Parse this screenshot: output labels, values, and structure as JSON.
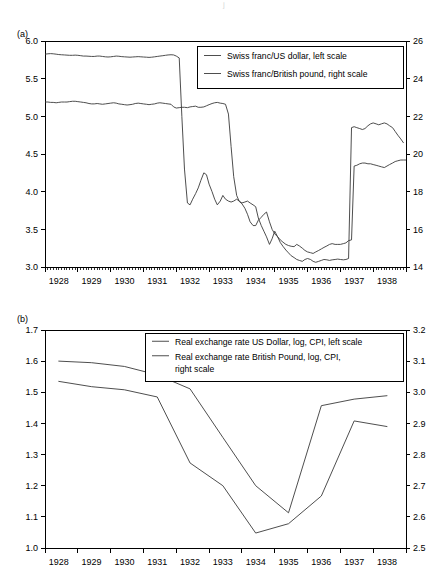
{
  "figure": {
    "top_fragment": "j",
    "panels": [
      {
        "id": "a",
        "label": "(a)"
      },
      {
        "id": "b",
        "label": "(b)"
      }
    ]
  },
  "chart_data": [
    {
      "type": "line",
      "panel": "(a)",
      "title": "",
      "xlabel": "",
      "ylabel": "",
      "grid": false,
      "legend_position": "top-center-right",
      "xlim": [
        1927.58,
        1938.58
      ],
      "x_tick_labels": [
        "1928",
        "1929",
        "1930",
        "1931",
        "1932",
        "1933",
        "1934",
        "1935",
        "1936",
        "1937",
        "1938"
      ],
      "x_tick_values": [
        1928,
        1929,
        1930,
        1931,
        1932,
        1933,
        1934,
        1935,
        1936,
        1937,
        1938
      ],
      "minor_ticks_per_year": 12,
      "left_axis": {
        "label": "Swiss franc/US dollar, left scale",
        "ylim": [
          3.0,
          6.0
        ],
        "ticks": [
          3.0,
          3.5,
          4.0,
          4.5,
          5.0,
          5.5,
          6.0
        ],
        "tick_labels": [
          "3.0",
          "3.5",
          "4.0",
          "4.5",
          "5.0",
          "5.5",
          "6.0"
        ]
      },
      "right_axis": {
        "label": "Swiss franc/British pound, right scale",
        "ylim": [
          14,
          26
        ],
        "ticks": [
          14,
          16,
          18,
          20,
          22,
          24,
          26
        ],
        "tick_labels": [
          "14",
          "16",
          "18",
          "20",
          "22",
          "24",
          "26"
        ]
      },
      "series": [
        {
          "name": "Swiss franc/US dollar, left scale",
          "axis": "left",
          "x": [
            1927.58,
            1927.67,
            1927.75,
            1927.83,
            1927.92,
            1928.0,
            1928.08,
            1928.17,
            1928.25,
            1928.33,
            1928.42,
            1928.5,
            1928.58,
            1928.67,
            1928.75,
            1928.83,
            1928.92,
            1929.0,
            1929.08,
            1929.17,
            1929.25,
            1929.33,
            1929.42,
            1929.5,
            1929.58,
            1929.67,
            1929.75,
            1929.83,
            1929.92,
            1930.0,
            1930.08,
            1930.17,
            1930.25,
            1930.33,
            1930.42,
            1930.5,
            1930.58,
            1930.67,
            1930.75,
            1930.83,
            1930.92,
            1931.0,
            1931.08,
            1931.17,
            1931.25,
            1931.33,
            1931.42,
            1931.5,
            1931.58,
            1931.67,
            1931.75,
            1931.83,
            1931.92,
            1932.0,
            1932.08,
            1932.17,
            1932.25,
            1932.33,
            1932.42,
            1932.5,
            1932.58,
            1932.67,
            1932.75,
            1932.83,
            1932.92,
            1933.0,
            1933.08,
            1933.17,
            1933.25,
            1933.33,
            1933.42,
            1933.5,
            1933.58,
            1933.67,
            1933.75,
            1933.83,
            1933.92,
            1934.0,
            1934.08,
            1934.17,
            1934.25,
            1934.33,
            1934.42,
            1934.5,
            1934.58,
            1934.67,
            1934.75,
            1934.83,
            1934.92,
            1935.0,
            1935.08,
            1935.17,
            1935.25,
            1935.33,
            1935.42,
            1935.5,
            1935.58,
            1935.67,
            1935.75,
            1935.83,
            1935.92,
            1936.0,
            1936.08,
            1936.17,
            1936.25,
            1936.33,
            1936.42,
            1936.5,
            1936.58,
            1936.67,
            1936.75,
            1936.83,
            1936.92,
            1937.0,
            1937.08,
            1937.17,
            1937.25,
            1937.33,
            1937.42,
            1937.5,
            1937.58,
            1937.67,
            1937.75,
            1937.83,
            1937.92,
            1938.0,
            1938.08,
            1938.17,
            1938.25,
            1938.33,
            1938.42,
            1938.5,
            1938.58
          ],
          "values": [
            5.19,
            5.19,
            5.185,
            5.185,
            5.18,
            5.185,
            5.19,
            5.19,
            5.19,
            5.195,
            5.2,
            5.2,
            5.195,
            5.19,
            5.185,
            5.18,
            5.17,
            5.165,
            5.165,
            5.17,
            5.165,
            5.16,
            5.165,
            5.17,
            5.175,
            5.18,
            5.175,
            5.165,
            5.16,
            5.155,
            5.15,
            5.155,
            5.16,
            5.17,
            5.175,
            5.17,
            5.165,
            5.16,
            5.155,
            5.16,
            5.165,
            5.175,
            5.18,
            5.175,
            5.17,
            5.165,
            5.16,
            5.125,
            5.11,
            5.115,
            5.12,
            5.12,
            5.115,
            5.125,
            5.13,
            5.135,
            5.12,
            5.12,
            5.125,
            5.14,
            5.155,
            5.17,
            5.18,
            5.185,
            5.175,
            5.17,
            5.16,
            5.03,
            4.6,
            4.2,
            3.95,
            3.87,
            3.84,
            3.78,
            3.7,
            3.6,
            3.55,
            3.55,
            3.62,
            3.66,
            3.7,
            3.73,
            3.6,
            3.5,
            3.44,
            3.4,
            3.36,
            3.33,
            3.3,
            3.285,
            3.275,
            3.27,
            3.3,
            3.28,
            3.25,
            3.22,
            3.2,
            3.19,
            3.18,
            3.2,
            3.22,
            3.24,
            3.26,
            3.28,
            3.3,
            3.31,
            3.3,
            3.3,
            3.3,
            3.31,
            3.32,
            3.35,
            3.36,
            4.34,
            4.35,
            4.37,
            4.38,
            4.38,
            4.37,
            4.37,
            4.36,
            4.35,
            4.34,
            4.33,
            4.32,
            4.34,
            4.36,
            4.38,
            4.4,
            4.41,
            4.42,
            4.42,
            4.42
          ]
        },
        {
          "name": "Swiss franc/British pound, right scale",
          "axis": "right",
          "x": [
            1927.58,
            1927.67,
            1927.75,
            1927.83,
            1927.92,
            1928.0,
            1928.08,
            1928.17,
            1928.25,
            1928.33,
            1928.42,
            1928.5,
            1928.58,
            1928.67,
            1928.75,
            1928.83,
            1928.92,
            1929.0,
            1929.08,
            1929.17,
            1929.25,
            1929.33,
            1929.42,
            1929.5,
            1929.58,
            1929.67,
            1929.75,
            1929.83,
            1929.92,
            1930.0,
            1930.08,
            1930.17,
            1930.25,
            1930.33,
            1930.42,
            1930.5,
            1930.58,
            1930.67,
            1930.75,
            1930.83,
            1930.92,
            1931.0,
            1931.08,
            1931.17,
            1931.25,
            1931.33,
            1931.42,
            1931.5,
            1931.58,
            1931.67,
            1931.75,
            1931.83,
            1931.92,
            1932.0,
            1932.08,
            1932.17,
            1932.25,
            1932.33,
            1932.42,
            1932.5,
            1932.58,
            1932.67,
            1932.75,
            1932.83,
            1932.92,
            1933.0,
            1933.08,
            1933.17,
            1933.25,
            1933.33,
            1933.42,
            1933.5,
            1933.58,
            1933.67,
            1933.75,
            1933.83,
            1933.92,
            1934.0,
            1934.08,
            1934.17,
            1934.25,
            1934.33,
            1934.42,
            1934.5,
            1934.58,
            1934.67,
            1934.75,
            1934.83,
            1934.92,
            1935.0,
            1935.08,
            1935.17,
            1935.25,
            1935.33,
            1935.42,
            1935.5,
            1935.58,
            1935.67,
            1935.75,
            1935.83,
            1935.92,
            1936.0,
            1936.08,
            1936.17,
            1936.25,
            1936.33,
            1936.42,
            1936.5,
            1936.58,
            1936.67,
            1936.75,
            1936.83,
            1936.92,
            1937.0,
            1937.08,
            1937.17,
            1937.25,
            1937.33,
            1937.42,
            1937.5,
            1937.58,
            1937.67,
            1937.75,
            1937.83,
            1937.92,
            1938.0,
            1938.08,
            1938.17,
            1938.25,
            1938.33,
            1938.42,
            1938.5,
            1938.58
          ],
          "values": [
            25.3,
            25.32,
            25.33,
            25.32,
            25.3,
            25.28,
            25.27,
            25.26,
            25.25,
            25.24,
            25.24,
            25.25,
            25.24,
            25.22,
            25.2,
            25.2,
            25.19,
            25.18,
            25.18,
            25.2,
            25.2,
            25.18,
            25.16,
            25.15,
            25.16,
            25.18,
            25.2,
            25.19,
            25.17,
            25.16,
            25.15,
            25.14,
            25.15,
            25.16,
            25.17,
            25.16,
            25.15,
            25.14,
            25.13,
            25.14,
            25.16,
            25.18,
            25.2,
            25.22,
            25.24,
            25.26,
            25.27,
            25.26,
            25.2,
            25.1,
            22.0,
            19.2,
            17.4,
            17.3,
            17.6,
            17.9,
            18.2,
            18.6,
            19.0,
            18.9,
            18.4,
            18.0,
            17.6,
            17.3,
            17.5,
            17.8,
            17.6,
            17.5,
            17.45,
            17.5,
            17.6,
            17.5,
            17.4,
            17.45,
            17.5,
            17.4,
            17.3,
            17.2,
            16.6,
            16.2,
            15.9,
            15.6,
            15.2,
            15.5,
            15.9,
            15.6,
            15.3,
            15.1,
            14.9,
            14.75,
            14.6,
            14.5,
            14.4,
            14.35,
            14.3,
            14.4,
            14.45,
            14.4,
            14.3,
            14.25,
            14.3,
            14.35,
            14.4,
            14.38,
            14.35,
            14.38,
            14.4,
            14.42,
            14.4,
            14.38,
            14.4,
            14.45,
            21.4,
            21.45,
            21.4,
            21.35,
            21.3,
            21.35,
            21.5,
            21.6,
            21.65,
            21.6,
            21.55,
            21.6,
            21.65,
            21.6,
            21.5,
            21.4,
            21.2,
            21.0,
            20.8,
            20.6
          ]
        }
      ]
    },
    {
      "type": "line",
      "panel": "(b)",
      "title": "",
      "xlabel": "",
      "ylabel": "",
      "grid": false,
      "legend_position": "top-center-right",
      "xlim": [
        1927.58,
        1938.58
      ],
      "x_tick_labels": [
        "1928",
        "1929",
        "1930",
        "1931",
        "1932",
        "1933",
        "1934",
        "1935",
        "1936",
        "1937",
        "1938"
      ],
      "x_tick_values": [
        1928,
        1929,
        1930,
        1931,
        1932,
        1933,
        1934,
        1935,
        1936,
        1937,
        1938
      ],
      "minor_ticks_per_year": 1,
      "left_axis": {
        "label": "Real exchange rate US Dollar, log, CPI, left scale",
        "ylim": [
          1.0,
          1.7
        ],
        "ticks": [
          1.0,
          1.1,
          1.2,
          1.3,
          1.4,
          1.5,
          1.6,
          1.7
        ],
        "tick_labels": [
          "1.0",
          "1.1",
          "1.2",
          "1.3",
          "1.4",
          "1.5",
          "1.6",
          "1.7"
        ]
      },
      "right_axis": {
        "label": "Real exchange rate British Pound, log, CPI, right scale",
        "ylim": [
          2.5,
          3.2
        ],
        "ticks": [
          2.5,
          2.6,
          2.7,
          2.8,
          2.9,
          3.0,
          3.1,
          3.2
        ],
        "tick_labels": [
          "2.5",
          "2.6",
          "2.7",
          "2.8",
          "2.9",
          "3.0",
          "3.1",
          "3.2"
        ]
      },
      "series": [
        {
          "name": "Real exchange rate US Dollar, log, CPI, left scale",
          "axis": "left",
          "x": [
            1928,
            1929,
            1930,
            1931,
            1932,
            1933,
            1934,
            1935,
            1936,
            1937,
            1938
          ],
          "values": [
            1.6,
            1.595,
            1.583,
            1.556,
            1.511,
            1.355,
            1.2,
            1.113,
            1.457,
            1.478,
            1.489
          ]
        },
        {
          "name": "Real exchange rate British Pound, log, CPI, right scale",
          "axis": "right",
          "x": [
            1928,
            1929,
            1930,
            1931,
            1932,
            1933,
            1934,
            1935,
            1936,
            1937,
            1938
          ],
          "values": [
            3.035,
            3.018,
            3.008,
            2.985,
            2.773,
            2.7,
            2.548,
            2.578,
            2.667,
            2.908,
            2.89
          ]
        }
      ]
    }
  ]
}
